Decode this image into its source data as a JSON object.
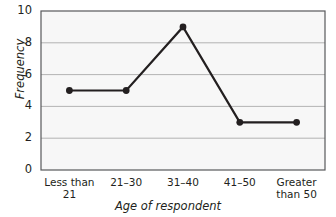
{
  "chart_data": {
    "type": "line",
    "title": "",
    "xlabel": "Age of respondent",
    "ylabel": "Frequency",
    "categories": [
      "Less than 21",
      "21–30",
      "31–40",
      "41–50",
      "Greater than 50"
    ],
    "category_lines": [
      [
        "Less than",
        "21"
      ],
      [
        "21–30",
        ""
      ],
      [
        "31–40",
        ""
      ],
      [
        "41–50",
        ""
      ],
      [
        "Greater",
        "than 50"
      ]
    ],
    "values": [
      5,
      5,
      9,
      3,
      3
    ],
    "ylim": [
      0,
      10
    ],
    "yticks": [
      0,
      2,
      4,
      6,
      8,
      10
    ],
    "ytick_labels": [
      "0",
      "2",
      "4",
      "6",
      "8",
      "10"
    ],
    "grid": true,
    "grid_axis": "y",
    "legend": false,
    "marker": "circle",
    "colors": {
      "line": "#231f20",
      "marker": "#231f20",
      "grid": "#b3b3b3",
      "axis": "#58595b",
      "plot_background": "#f7f7f7",
      "page_background": "#ffffff",
      "text": "#231f20"
    }
  }
}
